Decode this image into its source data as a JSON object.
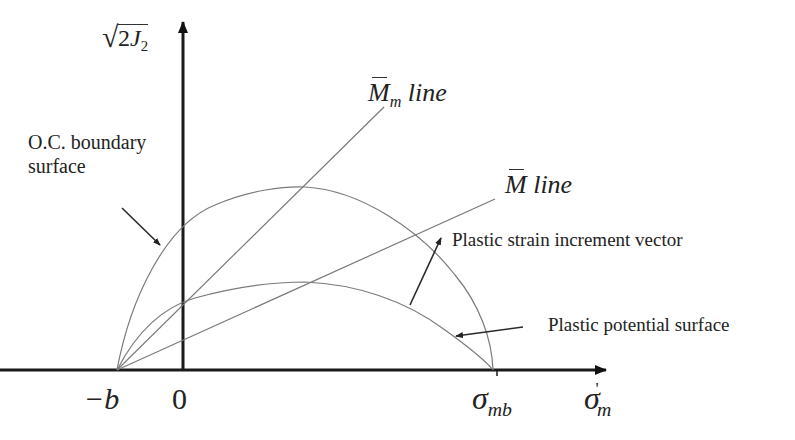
{
  "diagram": {
    "title": "",
    "axes": {
      "y_label": {
        "radical": "√",
        "coef": "2",
        "var": "J",
        "sub": "2"
      },
      "x_label": {
        "sym": "σ",
        "sub": "m",
        "prime": "'"
      },
      "origin_label": "0",
      "neg_b_label": "−b",
      "sigma_mb": {
        "sym": "σ",
        "sub": "mb"
      }
    },
    "lines": {
      "m_bar_m": {
        "sym": "M",
        "sub": "m",
        "text": "line"
      },
      "m_bar": {
        "sym": "M",
        "text": "line"
      }
    },
    "annotations": {
      "oc_boundary": [
        "O.C. boundary",
        "surface"
      ],
      "plastic_strain": "Plastic strain increment vector",
      "plastic_potential": "Plastic potential surface"
    },
    "colors": {
      "axis": "#1a1a1a",
      "curve": "#7a7a7a",
      "arrow": "#2a2a2a",
      "text": "#222222"
    }
  }
}
